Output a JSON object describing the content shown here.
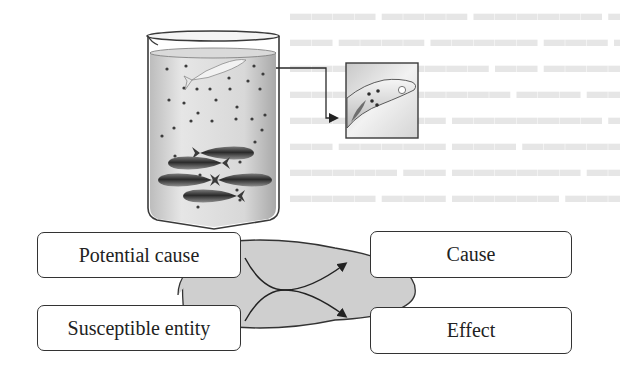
{
  "figure": {
    "top_illustration": {
      "beaker": {
        "label": "beaker-with-fish",
        "fish_count_bottom": 5,
        "fish_at_surface": 1
      },
      "inset": {
        "label": "magnified-fish-with-lesion"
      }
    },
    "diagram": {
      "left_boxes": [
        {
          "label": "Potential cause"
        },
        {
          "label": "Susceptible entity"
        }
      ],
      "right_boxes": [
        {
          "label": "Cause"
        },
        {
          "label": "Effect"
        }
      ],
      "center": {
        "shape": "ellipse",
        "fill": "#cfcfcf"
      }
    },
    "colors": {
      "line": "#2a2a2a",
      "ellipse_fill": "#cfcfcf",
      "box_border": "#333333"
    }
  }
}
